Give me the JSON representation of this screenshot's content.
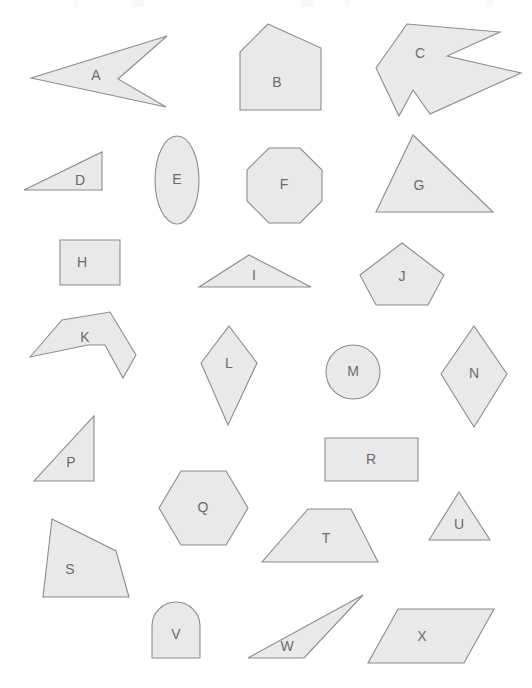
{
  "canvas": {
    "width": 532,
    "height": 688,
    "background": "#ffffff",
    "shape_fill": "#e9e9e9",
    "shape_stroke": "#8c8c8c",
    "label_color": "#6b6b6b"
  },
  "shapes": [
    {
      "id": "A",
      "label": "A",
      "kind": "concave-arrow",
      "label_x": 96,
      "label_y": 76,
      "points": "31,78 167,36 118,79 166,107"
    },
    {
      "id": "B",
      "label": "B",
      "kind": "pentagon",
      "label_x": 277,
      "label_y": 83,
      "points": "268,24 321,48 321,110 240,110 240,52"
    },
    {
      "id": "C",
      "label": "C",
      "kind": "concave-arrow",
      "label_x": 420,
      "label_y": 54,
      "points": "407,24 500,32 447,56 521,73 430,114 413,90 399,116 376,68"
    },
    {
      "id": "D",
      "label": "D",
      "kind": "right-triangle",
      "label_x": 80,
      "label_y": 181,
      "points": "102,152 102,190 24,190"
    },
    {
      "id": "E",
      "label": "E",
      "kind": "ellipse",
      "label_x": 177,
      "label_y": 180,
      "cx": 177,
      "cy": 180,
      "rx": 22,
      "ry": 44
    },
    {
      "id": "F",
      "label": "F",
      "kind": "octagon",
      "label_x": 284,
      "label_y": 185,
      "points": "269,148 300,148 322,170 322,201 300,223 269,223 247,201 247,170"
    },
    {
      "id": "G",
      "label": "G",
      "kind": "triangle",
      "label_x": 419,
      "label_y": 186,
      "points": "413,135 493,212 376,212"
    },
    {
      "id": "H",
      "label": "H",
      "kind": "square",
      "label_x": 82,
      "label_y": 263,
      "points": "60,240 120,240 120,285 60,285"
    },
    {
      "id": "I",
      "label": "I",
      "kind": "triangle",
      "label_x": 254,
      "label_y": 276,
      "points": "249,255 311,287 199,287"
    },
    {
      "id": "J",
      "label": "J",
      "kind": "pentagon",
      "label_x": 402,
      "label_y": 277,
      "points": "402,243 444,275 428,305 376,305 360,275"
    },
    {
      "id": "K",
      "label": "K",
      "kind": "concave-polygon",
      "label_x": 85,
      "label_y": 338,
      "points": "30,357 62,320 110,312 136,355 123,378 105,345 88,345"
    },
    {
      "id": "L",
      "label": "L",
      "kind": "kite",
      "label_x": 229,
      "label_y": 364,
      "points": "229,326 257,363 228,425 201,363"
    },
    {
      "id": "M",
      "label": "M",
      "kind": "circle",
      "label_x": 353,
      "label_y": 372,
      "cx": 353,
      "cy": 372,
      "rx": 27,
      "ry": 27
    },
    {
      "id": "N",
      "label": "N",
      "kind": "rhombus",
      "label_x": 474,
      "label_y": 374,
      "points": "474,326 507,374 474,427 441,374"
    },
    {
      "id": "P",
      "label": "P",
      "kind": "right-triangle",
      "label_x": 71,
      "label_y": 463,
      "points": "94,416 94,481 34,481"
    },
    {
      "id": "Q",
      "label": "Q",
      "kind": "hexagon",
      "label_x": 203,
      "label_y": 508,
      "points": "181,471 226,471 248,508 226,545 181,545 159,508"
    },
    {
      "id": "R",
      "label": "R",
      "kind": "rectangle",
      "label_x": 371,
      "label_y": 460,
      "points": "325,438 418,438 418,481 325,481"
    },
    {
      "id": "S",
      "label": "S",
      "kind": "quadrilateral",
      "label_x": 70,
      "label_y": 570,
      "points": "52,519 116,551 129,597 43,597"
    },
    {
      "id": "T",
      "label": "T",
      "kind": "trapezoid",
      "label_x": 326,
      "label_y": 539,
      "points": "308,509 351,509 378,562 262,562"
    },
    {
      "id": "U",
      "label": "U",
      "kind": "triangle",
      "label_x": 459,
      "label_y": 525,
      "points": "459,492 490,540 429,540"
    },
    {
      "id": "V",
      "label": "V",
      "kind": "arch",
      "label_x": 176,
      "label_y": 635,
      "arch": {
        "x": 152,
        "y": 602,
        "w": 48,
        "h": 56,
        "r": 24
      }
    },
    {
      "id": "W",
      "label": "W",
      "kind": "thin-triangle",
      "label_x": 287,
      "label_y": 647,
      "points": "363,595 304,658 248,658"
    },
    {
      "id": "X",
      "label": "X",
      "kind": "parallelogram",
      "label_x": 422,
      "label_y": 637,
      "points": "398,609 494,609 464,663 368,663"
    }
  ],
  "top_artifacts": [
    {
      "x": 74,
      "w": 4
    },
    {
      "x": 132,
      "w": 12
    },
    {
      "x": 301,
      "w": 12
    },
    {
      "x": 345,
      "w": 5
    },
    {
      "x": 487,
      "w": 6
    }
  ]
}
